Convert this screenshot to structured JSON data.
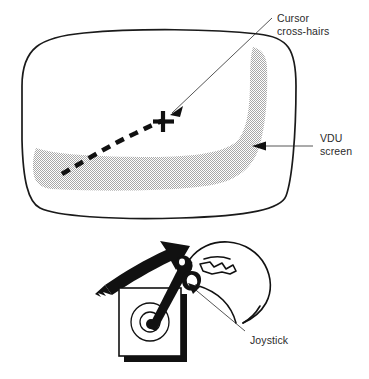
{
  "figure": {
    "background_color": "#ffffff",
    "ink_color": "#111111",
    "text_color": "#2b2b2b",
    "shade_color": "#b9b9b9"
  },
  "labels": {
    "cursor": {
      "line1": "Cursor",
      "line2": "cross-hairs"
    },
    "vdu": {
      "line1": "VDU",
      "line2": "screen"
    },
    "joystick": {
      "line1": "Joystick"
    }
  },
  "parts": {
    "monitor": "vdu-monitor",
    "screen_shading": "screen-shaded-border",
    "trace": "dashed-trace-curve",
    "crosshairs": "cursor-crosshairs",
    "joystick_base": "joystick-base",
    "joystick_stick": "joystick-stick",
    "hand": "operator-hand",
    "motion_arrow": "motion-arrow"
  },
  "icons": {
    "crosshair": "crosshair-icon",
    "arrow": "motion-arrow-icon",
    "pointer": "leader-arrowhead-icon"
  }
}
